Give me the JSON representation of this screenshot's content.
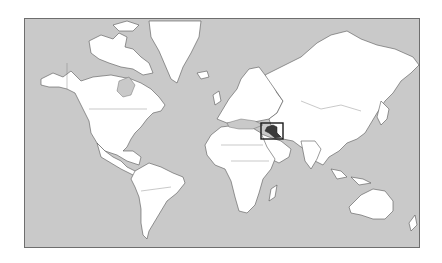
{
  "map": {
    "projection": "Mercator world map",
    "highlighted_country": "Iraq",
    "colors": {
      "ocean": "#c9c9c9",
      "land": "#ffffff",
      "highlight": "#3a3a3a",
      "frame": "#6e6e6e",
      "locator_box": "#1a1a1a"
    },
    "locator_box": {
      "x": 260,
      "y": 122,
      "width": 22,
      "height": 16
    }
  }
}
